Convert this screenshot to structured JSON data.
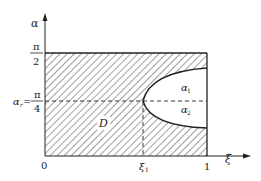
{
  "diagram": {
    "type": "region-plot",
    "axes": {
      "x_label": "ξ",
      "y_label": "α",
      "origin_label": "0",
      "x_ticks": [
        {
          "label": "ξ",
          "sub": "1",
          "value": "xi_1"
        },
        {
          "label": "1",
          "value": 1
        }
      ],
      "y_ticks": [
        {
          "num": "π",
          "den": "2",
          "value": "pi/2"
        },
        {
          "prefix": "α",
          "prefix_sub": "r",
          "eq": "=",
          "num": "π",
          "den": "4",
          "value": "pi/4"
        }
      ]
    },
    "regions": [
      {
        "label": "D",
        "style": "hatched"
      },
      {
        "label": "α",
        "sub": "1",
        "style": "blank"
      },
      {
        "label": "α",
        "sub": "2",
        "style": "blank"
      }
    ],
    "colors": {
      "line": "#222222",
      "hatch": "#444444",
      "background": "#ffffff"
    }
  }
}
